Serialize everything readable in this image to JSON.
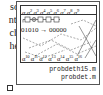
{
  "left_text": {
    "lines": [
      "so",
      "nt,",
      "ch",
      "he"
    ]
  },
  "figure": {
    "top_labels": [
      "α",
      "α2",
      "α3",
      "α4",
      "α5",
      "α6",
      "α7",
      "α8",
      "α9"
    ],
    "bottom_labels": [
      "α10",
      "α11",
      "α12",
      "α13",
      "α14",
      "α15",
      "α16"
    ],
    "mapping": {
      "from": "01010",
      "arrow": "→",
      "to": "00000"
    },
    "files": [
      "probdeth15.m",
      "probdet.m"
    ]
  },
  "end_mark": "□"
}
